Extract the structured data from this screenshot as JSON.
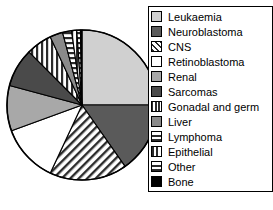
{
  "chart_data": {
    "type": "pie",
    "title": "",
    "legend_position": "right",
    "start_angle_deg": 0,
    "direction": "clockwise",
    "categories": [
      "Leukaemia",
      "Neuroblastoma",
      "CNS",
      "Retinoblastoma",
      "Renal",
      "Sarcomas",
      "Gonadal and germ",
      "Liver",
      "Lymphoma",
      "Epithelial",
      "Other",
      "Bone"
    ],
    "values": [
      25,
      15.3,
      16.7,
      12.5,
      9.7,
      8.3,
      5.6,
      2.8,
      1.9,
      1.1,
      0.8,
      0.3
    ],
    "slices": [
      {
        "label": "Leukaemia",
        "value": 25,
        "start_deg": 0,
        "end_deg": 90,
        "fill": "#d0d0d0",
        "pattern": "solid"
      },
      {
        "label": "Neuroblastoma",
        "value": 15.3,
        "start_deg": 90,
        "end_deg": 145,
        "fill": "#5a5a5a",
        "pattern": "solid"
      },
      {
        "label": "CNS",
        "value": 16.7,
        "start_deg": 145,
        "end_deg": 205,
        "fill": "#ffffff",
        "pattern": "diagonal"
      },
      {
        "label": "Retinoblastoma",
        "value": 12.5,
        "start_deg": 205,
        "end_deg": 250,
        "fill": "#ffffff",
        "pattern": "solid"
      },
      {
        "label": "Renal",
        "value": 9.7,
        "start_deg": 250,
        "end_deg": 285,
        "fill": "#a8a8a8",
        "pattern": "solid"
      },
      {
        "label": "Sarcomas",
        "value": 8.3,
        "start_deg": 285,
        "end_deg": 315,
        "fill": "#4a4a4a",
        "pattern": "solid"
      },
      {
        "label": "Gonadal and germ",
        "value": 5.6,
        "start_deg": 315,
        "end_deg": 335,
        "fill": "#ffffff",
        "pattern": "vertical"
      },
      {
        "label": "Liver",
        "value": 2.8,
        "start_deg": 335,
        "end_deg": 345,
        "fill": "#8a8a8a",
        "pattern": "solid"
      },
      {
        "label": "Lymphoma",
        "value": 1.9,
        "start_deg": 345,
        "end_deg": 352,
        "fill": "#ffffff",
        "pattern": "horizontal"
      },
      {
        "label": "Epithelial",
        "value": 1.1,
        "start_deg": 352,
        "end_deg": 356,
        "fill": "#ffffff",
        "pattern": "vertical"
      },
      {
        "label": "Other",
        "value": 0.8,
        "start_deg": 356,
        "end_deg": 358.8,
        "fill": "#ffffff",
        "pattern": "horizontal"
      },
      {
        "label": "Bone",
        "value": 0.3,
        "start_deg": 358.8,
        "end_deg": 360,
        "fill": "#000000",
        "pattern": "solid"
      }
    ]
  },
  "legend": {
    "items": [
      {
        "label": "Leukaemia",
        "swatch": "light-gray-solid"
      },
      {
        "label": "Neuroblastoma",
        "swatch": "dark-gray-solid"
      },
      {
        "label": "CNS",
        "swatch": "diagonal-hatch"
      },
      {
        "label": "Retinoblastoma",
        "swatch": "white-solid"
      },
      {
        "label": "Renal",
        "swatch": "mid-gray-solid"
      },
      {
        "label": "Sarcomas",
        "swatch": "charcoal-solid"
      },
      {
        "label": "Gonadal and germ",
        "swatch": "vertical-stripes"
      },
      {
        "label": "Liver",
        "swatch": "gray-solid"
      },
      {
        "label": "Lymphoma",
        "swatch": "horizontal-stripes"
      },
      {
        "label": "Epithelial",
        "swatch": "vertical-stripes-wide"
      },
      {
        "label": "Other",
        "swatch": "horizontal-stripes-wide"
      },
      {
        "label": "Bone",
        "swatch": "black-solid"
      }
    ]
  },
  "colors": {
    "outline": "#000000",
    "leukaemia": "#d0d0d0",
    "neuroblastoma": "#5a5a5a",
    "retinoblastoma": "#ffffff",
    "renal": "#a8a8a8",
    "sarcomas": "#4a4a4a",
    "liver": "#8a8a8a",
    "bone": "#000000"
  }
}
